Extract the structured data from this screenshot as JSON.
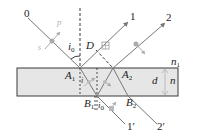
{
  "diagram": {
    "type": "thin-film interference ray diagram",
    "colors": {
      "plate_fill": "#e6e6e6",
      "plate_stroke": "#3a3a3a",
      "ray": "#777777",
      "polarization_marker": "#aaaaaa",
      "text": "#222222"
    },
    "labels": {
      "ray_0": "0",
      "ray_1": "1",
      "ray_2": "2",
      "ray_1_prime": "1′",
      "ray_2_prime": "2′",
      "point_A1": "A",
      "point_A1_sub": "1",
      "point_A2": "A",
      "point_A2_sub": "2",
      "point_B1": "B",
      "point_B1_sub": "1",
      "point_B2": "B",
      "point_B2_sub": "2",
      "point_D": "D",
      "angle_i0": "i",
      "angle_i0_sub": "0",
      "angle_i0_bottom": "i",
      "angle_i0_bottom_sub": "0",
      "angle_i_inner": "i",
      "thickness": "d",
      "index_plate": "n",
      "index_medium": "n",
      "index_medium_sub": "1",
      "pol_p": "p",
      "pol_s": "s"
    }
  }
}
